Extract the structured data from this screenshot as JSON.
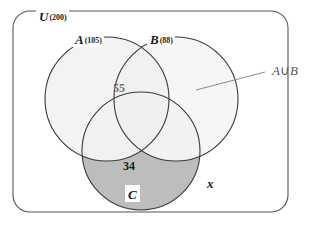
{
  "diagram": {
    "type": "venn-3-set",
    "universe": {
      "label": "U",
      "count": "(200)",
      "count_value": 200
    },
    "sets": [
      {
        "id": "A",
        "label": "A",
        "count": "(105)",
        "count_value": 105,
        "fill": "#efefef",
        "stroke": "#3a3a3a"
      },
      {
        "id": "B",
        "label": "B",
        "count": "(88)",
        "count_value": 88,
        "fill": "#efefef",
        "stroke": "#3a3a3a"
      },
      {
        "id": "C",
        "label": "C",
        "count": "",
        "count_value": null,
        "fill": "#bdbdbd",
        "stroke": "#3a3a3a"
      }
    ],
    "region_values": [
      {
        "region": "A-intersect-B",
        "value": "55",
        "style": "faint"
      },
      {
        "region": "C-only",
        "value": "34",
        "style": "bold"
      }
    ],
    "outside_label": "x",
    "annotation": {
      "text_a": "A",
      "operator": "∪",
      "text_b": "B",
      "full": "A∪B",
      "color": "#555555"
    },
    "colors": {
      "page_background": "#ffffff",
      "circle_ab_fill": "#efefef",
      "circle_c_only_fill": "#bdbdbd",
      "outline": "#3a3a3a",
      "box_outline": "#555555",
      "leader_line": "#8c8c8c",
      "faint_text": "#6e6e6e"
    }
  }
}
